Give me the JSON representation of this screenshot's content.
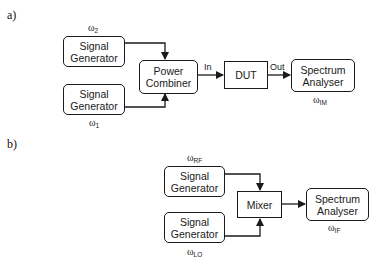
{
  "diagram_a": {
    "label": "a)",
    "blocks": {
      "sig_gen_top": {
        "label": "Signal\nGenerator",
        "freq_symbol": "ω",
        "freq_sub": "2"
      },
      "sig_gen_bottom": {
        "label": "Signal\nGenerator",
        "freq_symbol": "ω",
        "freq_sub": "1"
      },
      "power_combiner": {
        "label": "Power\nCombiner"
      },
      "dut": {
        "label": "DUT",
        "in_label": "In",
        "out_label": "Out"
      },
      "spectrum_analyser": {
        "label": "Spectrum\nAnalyser",
        "freq_symbol": "ω",
        "freq_sub": "IM"
      }
    }
  },
  "diagram_b": {
    "label": "b)",
    "blocks": {
      "sig_gen_top": {
        "label": "Signal\nGenerator",
        "freq_symbol": "ω",
        "freq_sub": "RF"
      },
      "sig_gen_bottom": {
        "label": "Signal\nGenerator",
        "freq_symbol": "ω",
        "freq_sub": "LO"
      },
      "mixer": {
        "label": "Mixer"
      },
      "spectrum_analyser": {
        "label": "Spectrum\nAnalyser",
        "freq_symbol": "ω",
        "freq_sub": "IF"
      }
    }
  },
  "colors": {
    "line": "#1a1a1a",
    "background": "#ffffff"
  }
}
